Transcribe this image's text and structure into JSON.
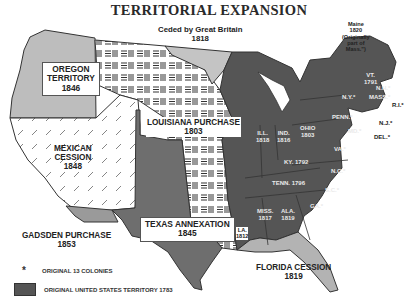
{
  "title": "TERRITORIAL EXPANSION",
  "colors": {
    "original_territory": "#555555",
    "oregon": "#bdbdbd",
    "british_cession": "#c4c4c4",
    "texas": "#6e6e6e",
    "gadsden": "#9a9a9a",
    "florida": "#b3b3b3",
    "mexican_cession_bg": "#ffffff",
    "louisiana_pattern": "#333333"
  },
  "regions": {
    "oregon": {
      "name": "OREGON",
      "name2": "TERRITORY",
      "year": "1846"
    },
    "british": {
      "name": "Ceded by Great Britain",
      "year": "1818"
    },
    "louisiana": {
      "name": "LOUISIANA PURCHASE",
      "year": "1803"
    },
    "mexican": {
      "name": "MEXICAN",
      "name2": "CESSION",
      "year": "1848"
    },
    "gadsden": {
      "name": "GADSDEN PURCHASE",
      "year": "1853"
    },
    "texas": {
      "name": "TEXAS ANNEXATION",
      "year": "1845"
    },
    "florida": {
      "name": "FLORIDA CESSION",
      "year": "1819"
    },
    "maine": {
      "l1": "Maine",
      "l2": "1820",
      "l3": "(Originally",
      "l4": "part of",
      "l5": "Mass.\")"
    },
    "la_state": {
      "name": "LA.",
      "year": "1812"
    }
  },
  "states": {
    "ill": {
      "name": "ILL.",
      "year": "1818"
    },
    "ind": {
      "name": "IND.",
      "year": "1816"
    },
    "ohio": {
      "name": "OHIO",
      "year": "1803"
    },
    "ky": {
      "name": "KY. 1792"
    },
    "tenn": {
      "name": "TENN. 1796"
    },
    "miss": {
      "name": "MISS.",
      "year": "1817"
    },
    "ala": {
      "name": "ALA.",
      "year": "1819"
    },
    "ga": {
      "name": "GA.*"
    },
    "sc": {
      "name": "S.C.*"
    },
    "nc": {
      "name": "N.C.*"
    },
    "va": {
      "name": "VA.*"
    },
    "md": {
      "name": "MD.*"
    },
    "del": {
      "name": "DEL.*"
    },
    "nj": {
      "name": "N.J.*"
    },
    "penn": {
      "name": "PENN.*"
    },
    "ny": {
      "name": "N.Y.*"
    },
    "vt": {
      "name": "VT.",
      "year": "1791"
    },
    "nh": {
      "name": "N.H.*"
    },
    "mass": {
      "name": "MASS.*"
    },
    "ri": {
      "name": "R.I.*"
    }
  },
  "legend": {
    "star_symbol": "*",
    "colonies_label": "ORIGINAL 13 COLONIES",
    "territory_label": "ORIGINAL UNITED STATES TERRITORY 1783"
  }
}
